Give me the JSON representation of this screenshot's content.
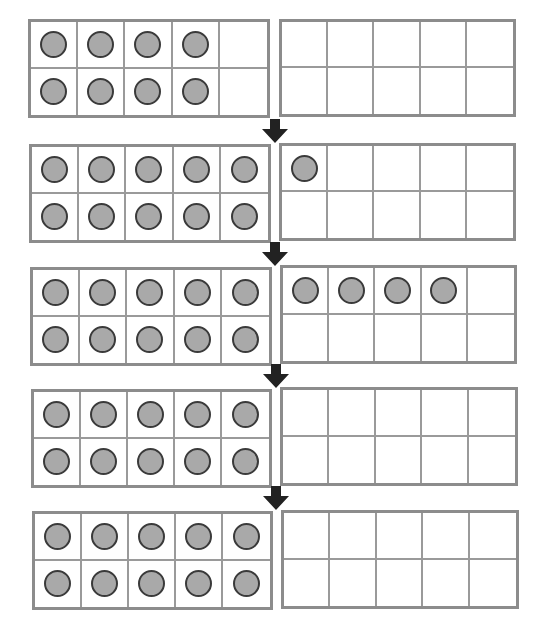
{
  "diagram": {
    "type": "ten-frames-addition",
    "colors": {
      "frame_border": "#8c8c8c",
      "grid_line": "#9a9a9a",
      "counter_fill": "#a9a9a9",
      "counter_stroke": "#3a3a3a",
      "arrow": "#222222"
    },
    "rows": [
      {
        "left": {
          "x": 28,
          "y": 19,
          "w": 242,
          "h": 99,
          "filled": 8
        },
        "right": {
          "x": 279,
          "y": 19,
          "w": 237,
          "h": 98,
          "filled": 0
        }
      },
      {
        "left": {
          "x": 29,
          "y": 144,
          "w": 242,
          "h": 99,
          "filled": 10
        },
        "right": {
          "x": 279,
          "y": 143,
          "w": 237,
          "h": 98,
          "filled": 1
        }
      },
      {
        "left": {
          "x": 30,
          "y": 267,
          "w": 242,
          "h": 99,
          "filled": 10
        },
        "right": {
          "x": 280,
          "y": 265,
          "w": 237,
          "h": 99,
          "filled": 4
        }
      },
      {
        "left": {
          "x": 31,
          "y": 389,
          "w": 241,
          "h": 99,
          "filled": 10
        },
        "right": {
          "x": 280,
          "y": 387,
          "w": 238,
          "h": 99,
          "filled": 0
        }
      },
      {
        "left": {
          "x": 32,
          "y": 511,
          "w": 241,
          "h": 99,
          "filled": 10
        },
        "right": {
          "x": 281,
          "y": 510,
          "w": 238,
          "h": 99,
          "filled": 0
        }
      }
    ],
    "arrows": [
      {
        "x": 262,
        "y": 119,
        "direction": "down"
      },
      {
        "x": 262,
        "y": 242,
        "direction": "down"
      },
      {
        "x": 263,
        "y": 364,
        "direction": "down"
      },
      {
        "x": 263,
        "y": 486,
        "direction": "down"
      }
    ]
  }
}
